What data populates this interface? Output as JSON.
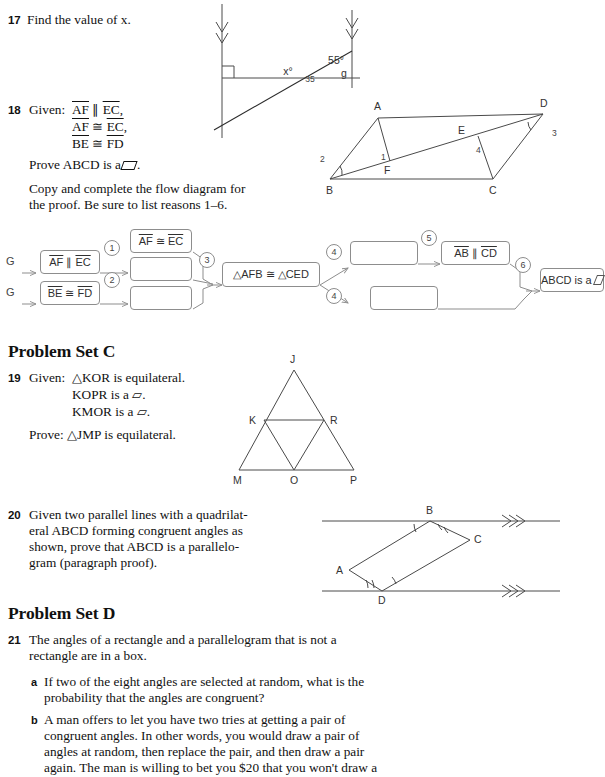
{
  "page": {
    "width": 583,
    "height": 761,
    "background": "#ffffff",
    "ink": "#111111",
    "figure_ink": "#4a4a4a"
  },
  "problems": {
    "p17": {
      "number": "17",
      "text": "Find the value of x.",
      "figure": {
        "name": "two-parallel-lines-transversal",
        "angle_x_label": "x°",
        "angle_55_label": "55°",
        "angle_small_label": "35",
        "point_label": "g",
        "right_angle_marker": true,
        "arrow_marks": "double-chevron"
      }
    },
    "p18": {
      "number": "18",
      "given_label": "Given:",
      "given_lines": [
        "AF ∥ EC,",
        "AF ≅ EC,",
        "BE ≅ FD"
      ],
      "prove_label": "Prove",
      "prove_text": "ABCD is a",
      "prove_suffix": ".",
      "instructions_line1": "Copy and complete the flow diagram for",
      "instructions_line2": "the proof. Be sure to list reasons 1–6.",
      "figure": {
        "name": "parallelogram-abcd-with-efs",
        "vertices": [
          "A",
          "B",
          "C",
          "D"
        ],
        "interior_points": [
          "E",
          "F"
        ],
        "angle_labels": [
          "1",
          "2",
          "3",
          "4"
        ]
      },
      "flow": {
        "given_marks": [
          "G",
          "G"
        ],
        "boxes": [
          {
            "id": "b1",
            "text": "AF ∥ EC",
            "filled": true
          },
          {
            "id": "b2",
            "text": "BE ≅ FD",
            "filled": true
          },
          {
            "id": "b3",
            "text": "AF ≅ EC",
            "filled": true
          },
          {
            "id": "b4",
            "text": "",
            "filled": false
          },
          {
            "id": "b5",
            "text": "",
            "filled": false
          },
          {
            "id": "b6",
            "text": "△AFB ≅ △CED",
            "filled": true
          },
          {
            "id": "b7",
            "text": "",
            "filled": false
          },
          {
            "id": "b8",
            "text": "",
            "filled": false
          },
          {
            "id": "b9",
            "text": "AB ∥ CD",
            "filled": true
          },
          {
            "id": "b10",
            "text": "ABCD is a",
            "filled": true,
            "has_pgram_glyph": true
          }
        ],
        "reason_numbers": [
          "1",
          "2",
          "3",
          "4",
          "4",
          "5",
          "6"
        ]
      }
    },
    "p19": {
      "number": "19",
      "given_label": "Given:",
      "given_lines": [
        "△KOR is equilateral.",
        "KOPR is a ▱.",
        "KMOR is a ▱."
      ],
      "prove_label": "Prove:",
      "prove_text": "△JMP is equilateral.",
      "figure": {
        "name": "equilateral-triangle-jmp-subdivided",
        "labels": [
          "J",
          "K",
          "R",
          "M",
          "O",
          "P"
        ]
      }
    },
    "p20": {
      "number": "20",
      "lines": [
        "Given two parallel lines with a quadrilat-",
        "eral ABCD forming congruent angles as",
        "shown, prove that ABCD is a parallelo-",
        "gram (paragraph proof)."
      ],
      "figure": {
        "name": "quadrilateral-between-parallel-lines",
        "labels": [
          "A",
          "B",
          "C",
          "D"
        ],
        "arrow_marks": "triple-chevron"
      }
    },
    "p21": {
      "number": "21",
      "lines": [
        "The angles of a rectangle and a parallelogram that is not a",
        "rectangle are in a box."
      ],
      "parts": [
        {
          "label": "a",
          "lines": [
            "If two of the eight angles are selected at random, what is the",
            "probability that the angles are congruent?"
          ]
        },
        {
          "label": "b",
          "lines": [
            "A man offers to let you have two tries at getting a pair of",
            "congruent angles. In other words, you would draw a pair of",
            "angles at random, then replace the pair, and then draw a pair",
            "again. The man is willing to bet you $20 that you won't draw a"
          ]
        }
      ]
    }
  },
  "headings": {
    "set_c": "Problem Set C",
    "set_d": "Problem Set D"
  }
}
